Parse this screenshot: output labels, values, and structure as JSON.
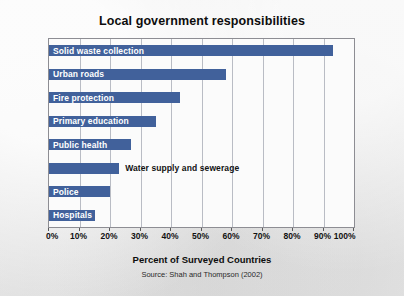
{
  "chart_data": {
    "type": "bar",
    "orientation": "horizontal",
    "title": "Local government responsibilities",
    "xlabel": "Percent of Surveyed Countries",
    "ylabel": "",
    "source": "Source: Shah and Thompson (2002)",
    "xlim": [
      0,
      100
    ],
    "grid": true,
    "legend": false,
    "xtick_labels": [
      "0%",
      "10%",
      "20%",
      "30%",
      "40%",
      "50%",
      "60%",
      "70%",
      "80%",
      "90%",
      "100%"
    ],
    "xticks": [
      0,
      10,
      20,
      30,
      40,
      50,
      60,
      70,
      80,
      90,
      100
    ],
    "categories": [
      "Solid waste collection",
      "Urban roads",
      "Fire protection",
      "Primary education",
      "Public health",
      "Water supply and sewerage",
      "Police",
      "Hospitals"
    ],
    "values": [
      93,
      58,
      43,
      35,
      27,
      23,
      20,
      15
    ],
    "label_placement": [
      "inside",
      "inside",
      "inside",
      "inside",
      "inside",
      "outside",
      "inside",
      "inside"
    ],
    "bar_color": "#41619b",
    "inside_label_color": "#ffffff",
    "outside_label_color": "#111111",
    "plot_background": "#fbfbfb",
    "gridline_color": "#b9bcc4",
    "page_background": "#e9e9e9"
  }
}
